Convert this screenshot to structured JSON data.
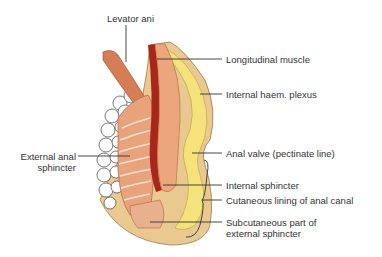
{
  "diagram": {
    "title": "",
    "labels": [
      {
        "id": "levator-ani",
        "text": "Levator ani"
      },
      {
        "id": "longitudinal-muscle",
        "text": "Longitudinal muscle"
      },
      {
        "id": "internal-haem-plexus",
        "text": "Internal haem. plexus"
      },
      {
        "id": "external-anal-sphincter",
        "lines": [
          "External anal",
          "sphincter"
        ]
      },
      {
        "id": "anal-valve",
        "text": "Anal valve (pectinate line)"
      },
      {
        "id": "internal-sphincter",
        "text": "Internal sphincter"
      },
      {
        "id": "cutaneous-lining",
        "text": "Cutaneous lining of anal canal"
      },
      {
        "id": "subcutaneous-external-sphincter",
        "lines": [
          "Subcutaneous part of",
          "external sphincter"
        ]
      }
    ],
    "colors": {
      "muscle": "#e8a27c",
      "muscle_dark": "#c8643e",
      "mucosa": "#a8261a",
      "skin": "#e9c98f",
      "fat": "#f5e27a",
      "leader": "#333333",
      "text": "#333333"
    }
  }
}
